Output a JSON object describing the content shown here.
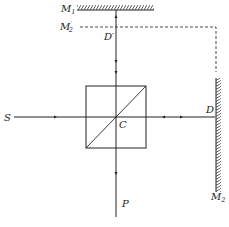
{
  "diagram": {
    "type": "Michelson interferometer",
    "labels": {
      "mirror1": "M",
      "mirror1_sub": "1",
      "mirror2_image": "M",
      "mirror2_image_prime": "′",
      "mirror2_image_sub": "2",
      "point_d_prime": "D′",
      "source": "S",
      "center": "C",
      "point_d": "D",
      "mirror2": "M",
      "mirror2_sub": "2",
      "output": "P"
    },
    "colors": {
      "line": "#222222",
      "background": "#ffffff"
    }
  }
}
